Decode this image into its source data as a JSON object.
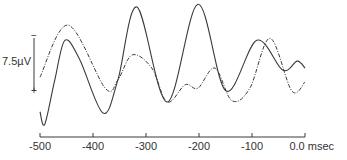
{
  "chart_data": {
    "type": "line",
    "title": "",
    "xlabel": "msec",
    "ylabel": "",
    "xlim": [
      -500,
      0
    ],
    "x_ticks": [
      -500,
      -400,
      -300,
      -200,
      -100,
      0
    ],
    "x_tick_labels": [
      "-500",
      "-400",
      "-300",
      "-200",
      "-100",
      "0.0"
    ],
    "x_unit_label": "msec",
    "grid": false,
    "legend": null,
    "scale_bar": {
      "label": "7.5µV",
      "value_uV": 7.5,
      "top_polarity": "−",
      "bottom_polarity": "+",
      "note": "negative up"
    },
    "series": [
      {
        "name": "solid trace",
        "style": "solid",
        "color": "#3a3a3a",
        "x": [
          -500,
          -491,
          -472,
          -453,
          -425,
          -381,
          -353,
          -317,
          -260,
          -202,
          -149,
          -91,
          -42,
          -15,
          0
        ],
        "y": [
          5.3,
          7.1,
          0.7,
          -5.0,
          -2.2,
          5.5,
          0.7,
          -9.8,
          3.9,
          -10.2,
          2.3,
          -5.0,
          -0.7,
          -2.0,
          -1.0
        ]
      },
      {
        "name": "dashed trace",
        "style": "dash-dot",
        "color": "#3a3a3a",
        "x": [
          -500,
          -447,
          -377,
          -353,
          -326,
          -289,
          -260,
          -226,
          -202,
          -170,
          -138,
          -104,
          -66,
          -25,
          0
        ],
        "y": [
          0.3,
          -7.2,
          1.9,
          0.7,
          -2.9,
          -1.0,
          3.9,
          1.4,
          1.9,
          -1.0,
          3.7,
          1.9,
          -5.3,
          2.3,
          1.0
        ]
      }
    ]
  },
  "labels": {
    "scale": "7.5µV",
    "minus": "−",
    "plus": "+",
    "unit": "msec"
  }
}
